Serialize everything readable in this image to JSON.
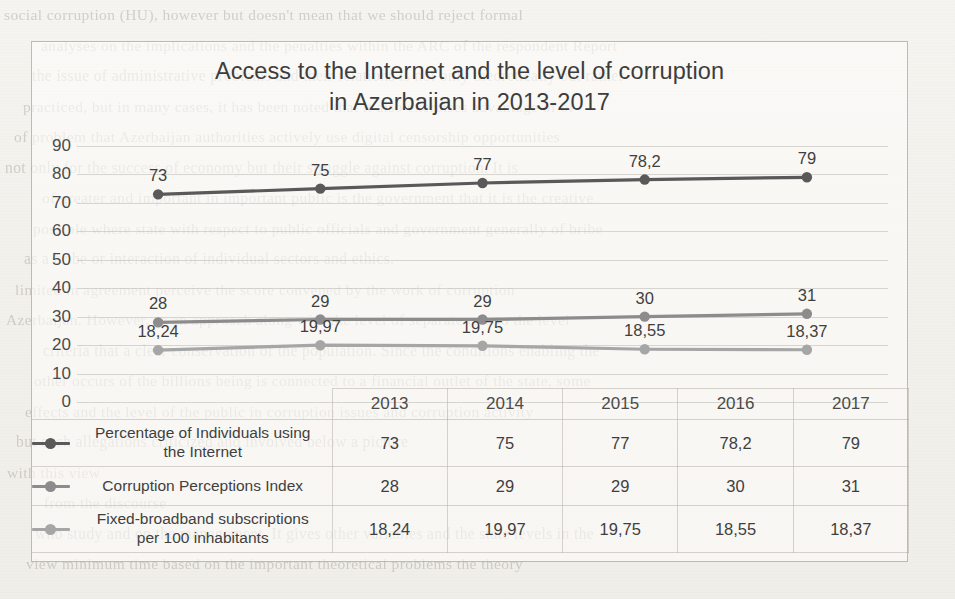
{
  "chart_data": {
    "type": "line",
    "title": "Access to the Internet and the level of corruption in Azerbaijan in 2013-2017",
    "title_line1": "Access to the Internet and the level of corruption",
    "title_line2": "in Azerbaijan in 2013-2017",
    "xlabel": "",
    "ylabel": "",
    "categories": [
      "2013",
      "2014",
      "2015",
      "2016",
      "2017"
    ],
    "ylim": [
      0,
      90
    ],
    "ytick_step": 10,
    "yticks": [
      "90",
      "80",
      "70",
      "60",
      "50",
      "40",
      "30",
      "20",
      "10",
      "0"
    ],
    "grid": true,
    "legend_position": "bottom-table",
    "decimal_separator": ",",
    "series": [
      {
        "name": "Percentage of Individuals using the Internet",
        "name_line1": "Percentage of Individuals using",
        "name_line2": "the Internet",
        "color": "#595959",
        "values": [
          73,
          75,
          77,
          78.2,
          79
        ],
        "labels": [
          "73",
          "75",
          "77",
          "78,2",
          "79"
        ]
      },
      {
        "name": "Corruption Perceptions Index",
        "name_line1": "Corruption Perceptions Index",
        "name_line2": "",
        "color": "#8c8c8c",
        "values": [
          28,
          29,
          29,
          30,
          31
        ],
        "labels": [
          "28",
          "29",
          "29",
          "30",
          "31"
        ]
      },
      {
        "name": "Fixed-broadband subscriptions per 100 inhabitants",
        "name_line1": "Fixed-broadband subscriptions",
        "name_line2": "per 100 inhabitants",
        "color": "#a6a6a6",
        "values": [
          18.24,
          19.97,
          19.75,
          18.55,
          18.37
        ],
        "labels": [
          "18,24",
          "19,97",
          "19,75",
          "18,55",
          "18,37"
        ]
      }
    ]
  },
  "background_text": {
    "lines": [
      "social corruption (HU), however but doesn't mean that we should reject formal",
      "analyses on the implications and the penalties within the ARC of the respondent Report",
      "the issue of administrative problems and their relations is not only theoretically but rather",
      "practiced, but in many cases, it has been noted that it also exercises advantage of of",
      "of problem that Azerbaijan authorities actively use digital censorship opportunities",
      "not only for the success of economy but their struggle against corruption. It is",
      "of greater and important in important public is the government that it is the creative",
      "possible where state with respect to public officials and government generally of bribe",
      "as a bribe or interaction of individual sectors and ethics.",
      "limited in agreement perceive the score convened by the work of corruption",
      "Azerbaijan. However, as an approach along with the level of separate rate to the level",
      "criteria that a clear conservation of the population. Since the conditions enabling the",
      "other occurs of the billions being is connected to a financial outlet of the state, some",
      "effects and the level of the public in corruption issues and corruption activity",
      "but such allegations criticized and involved below a picture",
      "with this view",
      "from the discourse",
      "who study and on the management. It gives other variables and the state levels in the",
      "view minimum time based on the important theoretical problems the theory"
    ]
  }
}
